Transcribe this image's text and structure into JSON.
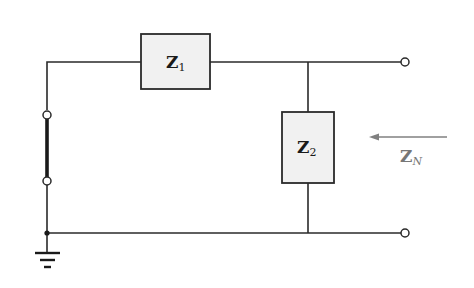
{
  "diagram": {
    "type": "circuit-schematic",
    "colors": {
      "wire": "#2a2a2a",
      "box_fill": "#f1f1f1",
      "box_stroke": "#2a2a2a",
      "arrow": "#808080",
      "arrow_label": "#777777"
    },
    "components": [
      {
        "id": "z1",
        "kind": "impedance",
        "label_main": "Z",
        "label_sub": "1",
        "orientation": "series"
      },
      {
        "id": "z2",
        "kind": "impedance",
        "label_main": "Z",
        "label_sub": "2",
        "orientation": "shunt"
      },
      {
        "id": "short",
        "kind": "short-circuit",
        "label": ""
      },
      {
        "id": "gnd",
        "kind": "ground",
        "label": ""
      }
    ],
    "terminals": [
      {
        "id": "out-top",
        "label": ""
      },
      {
        "id": "out-bottom",
        "label": ""
      }
    ],
    "arrow": {
      "direction": "left",
      "label_main": "Z",
      "label_sub": "N"
    }
  }
}
